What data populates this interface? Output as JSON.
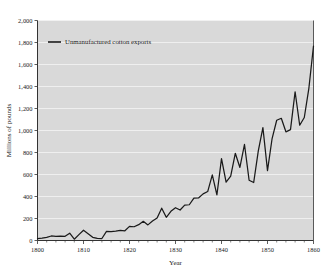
{
  "chart_data": {
    "type": "line",
    "title": "",
    "xlabel": "Year",
    "ylabel": "Millions of pounds",
    "xlim": [
      1800,
      1860
    ],
    "ylim": [
      0,
      2000
    ],
    "grid": true,
    "legend_position": "top-left",
    "series": [
      {
        "name": "Unmanufactured cotton exports",
        "color": "#1a1a1a",
        "x": [
          1800,
          1801,
          1802,
          1803,
          1804,
          1805,
          1806,
          1807,
          1808,
          1809,
          1810,
          1811,
          1812,
          1813,
          1814,
          1815,
          1816,
          1817,
          1818,
          1819,
          1820,
          1821,
          1822,
          1823,
          1824,
          1825,
          1826,
          1827,
          1828,
          1829,
          1830,
          1831,
          1832,
          1833,
          1834,
          1835,
          1836,
          1837,
          1838,
          1839,
          1840,
          1841,
          1842,
          1843,
          1844,
          1845,
          1846,
          1847,
          1848,
          1849,
          1850,
          1851,
          1852,
          1853,
          1854,
          1855,
          1856,
          1857,
          1858,
          1859,
          1860
        ],
        "values": [
          18,
          21,
          28,
          41,
          38,
          40,
          38,
          66,
          12,
          53,
          93,
          62,
          29,
          19,
          18,
          83,
          81,
          86,
          92,
          88,
          128,
          125,
          144,
          174,
          142,
          177,
          205,
          294,
          211,
          265,
          298,
          277,
          322,
          325,
          385,
          387,
          424,
          445,
          596,
          414,
          744,
          531,
          585,
          793,
          664,
          873,
          548,
          527,
          815,
          1027,
          635,
          927,
          1093,
          1111,
          988,
          1008,
          1352,
          1048,
          1118,
          1386,
          1768
        ]
      }
    ],
    "y_ticks": [
      {
        "value": 0,
        "label": "0"
      },
      {
        "value": 200,
        "label": "200"
      },
      {
        "value": 400,
        "label": "400"
      },
      {
        "value": 600,
        "label": "600"
      },
      {
        "value": 800,
        "label": "800"
      },
      {
        "value": 1000,
        "label": "1,000"
      },
      {
        "value": 1200,
        "label": "1,200"
      },
      {
        "value": 1400,
        "label": "1,400"
      },
      {
        "value": 1600,
        "label": "1,600"
      },
      {
        "value": 1800,
        "label": "1,800"
      },
      {
        "value": 2000,
        "label": "2,000"
      }
    ],
    "x_ticks": [
      {
        "value": 1800,
        "label": "1800"
      },
      {
        "value": 1810,
        "label": "1810"
      },
      {
        "value": 1820,
        "label": "1820"
      },
      {
        "value": 1830,
        "label": "1830"
      },
      {
        "value": 1840,
        "label": "1840"
      },
      {
        "value": 1850,
        "label": "1850"
      },
      {
        "value": 1860,
        "label": "1860"
      }
    ],
    "x_minor_step": 2,
    "colors": {
      "plot_background": "#d9d9d9",
      "gridline": "#f2f2f2",
      "axis": "#333333",
      "line": "#1a1a1a",
      "text": "#1a1a1a"
    }
  },
  "legend": {
    "entries": [
      {
        "label": "Unmanufactured cotton exports",
        "color": "#1a1a1a"
      }
    ]
  },
  "axes": {
    "x_title": "Year",
    "y_title": "Millions of pounds"
  }
}
